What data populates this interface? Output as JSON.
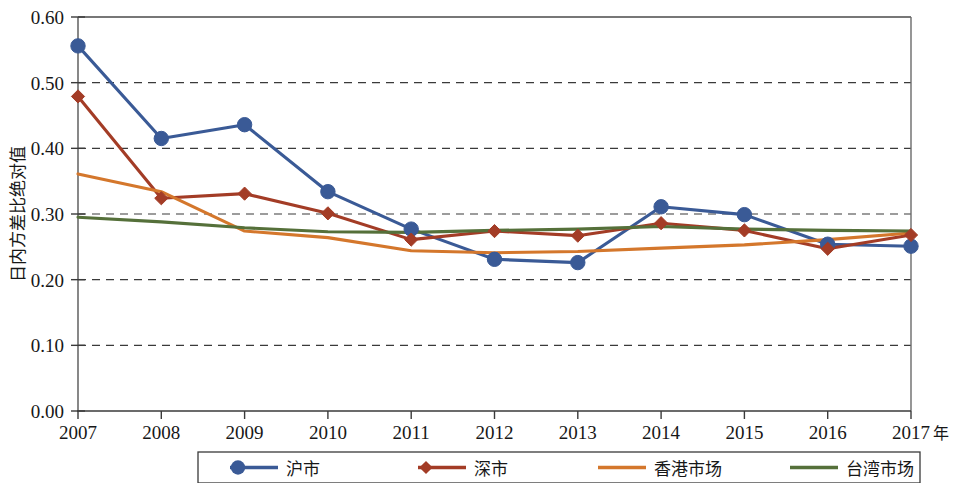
{
  "chart_data": {
    "type": "line",
    "title": "",
    "subtitle": "",
    "xlabel": "年",
    "ylabel": "日内方差比绝对值",
    "x": [
      2007,
      2008,
      2009,
      2010,
      2011,
      2012,
      2013,
      2014,
      2015,
      2016,
      2017
    ],
    "categories": [
      "2007",
      "2008",
      "2009",
      "2010",
      "2011",
      "2012",
      "2013",
      "2014",
      "2015",
      "2016",
      "2017"
    ],
    "xlim": [
      2007,
      2017
    ],
    "ylim": [
      0.0,
      0.6
    ],
    "yticks": [
      0.0,
      0.1,
      0.2,
      0.3,
      0.4,
      0.5,
      0.6
    ],
    "ytick_labels": [
      "0.00",
      "0.10",
      "0.20",
      "0.30",
      "0.40",
      "0.50",
      "0.60"
    ],
    "grid": "horizontal-dashed",
    "legend_position": "bottom",
    "series": [
      {
        "name": "沪市",
        "color": "#3a5a96",
        "marker": "circle",
        "values": [
          0.556,
          0.415,
          0.436,
          0.334,
          0.277,
          0.231,
          0.226,
          0.311,
          0.299,
          0.254,
          0.251
        ]
      },
      {
        "name": "深市",
        "color": "#a33c26",
        "marker": "diamond",
        "values": [
          0.479,
          0.324,
          0.331,
          0.301,
          0.261,
          0.274,
          0.267,
          0.286,
          0.275,
          0.247,
          0.268
        ]
      },
      {
        "name": "香港市场",
        "color": "#d4772c",
        "marker": "none",
        "values": [
          0.361,
          0.334,
          0.274,
          0.264,
          0.244,
          0.241,
          0.243,
          0.248,
          0.253,
          0.261,
          0.271
        ]
      },
      {
        "name": "台湾市场",
        "color": "#55703a",
        "marker": "none",
        "values": [
          0.295,
          0.288,
          0.279,
          0.273,
          0.272,
          0.275,
          0.277,
          0.281,
          0.277,
          0.275,
          0.274
        ]
      }
    ]
  },
  "legend": {
    "items": [
      {
        "label": "沪市",
        "color": "#3a5a96",
        "marker": "circle"
      },
      {
        "label": "深市",
        "color": "#a33c26",
        "marker": "diamond"
      },
      {
        "label": "香港市场",
        "color": "#d4772c",
        "marker": "none"
      },
      {
        "label": "台湾市场",
        "color": "#55703a",
        "marker": "none"
      }
    ]
  },
  "axes": {
    "y_title": "日内方差比绝对值",
    "x_unit": "年"
  }
}
